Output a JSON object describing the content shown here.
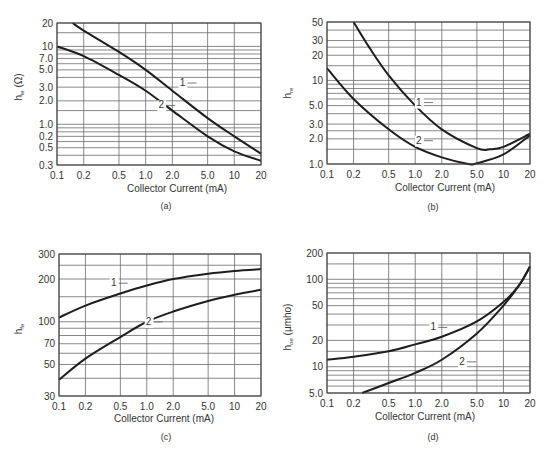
{
  "figure": {
    "panels": [
      "(a)",
      "(b)",
      "(c)",
      "(d)"
    ]
  },
  "chart_data": [
    {
      "id": "a",
      "type": "line",
      "panel_label": "(a)",
      "xlabel": "Collector Current (mA)",
      "ylabel": "h_ie (Ω)",
      "ylabel_main": "h",
      "ylabel_sub": "ie",
      "ylabel_unit": " (Ω)",
      "xscale": "log",
      "yscale": "log",
      "xlim": [
        0.1,
        20
      ],
      "ylim": [
        0.3,
        20
      ],
      "grid": true,
      "xticks": [
        0.1,
        0.2,
        0.5,
        1.0,
        2.0,
        5.0,
        10,
        20
      ],
      "xtick_labels": [
        "0.1",
        "0.2",
        "0.5",
        "1.0",
        "2.0",
        "5.0",
        "10",
        "20"
      ],
      "yticks": [
        0.3,
        0.5,
        0.7,
        1.0,
        2.0,
        3.0,
        5.0,
        7.0,
        10,
        20
      ],
      "ytick_labels": [
        "0.3",
        "0.5",
        "0.2",
        "1.0",
        "2.0",
        "3.0",
        "5.0",
        "7.0",
        "10",
        "20"
      ],
      "ygrid_minor": [
        0.4,
        0.6,
        0.8,
        0.9,
        1.5,
        4,
        6,
        8,
        9,
        15
      ],
      "series": [
        {
          "name": "1",
          "x": [
            0.15,
            0.2,
            0.5,
            1.0,
            2.0,
            5.0,
            10,
            20
          ],
          "y": [
            20,
            16,
            8.5,
            5.0,
            2.7,
            1.2,
            0.7,
            0.42
          ]
        },
        {
          "name": "2",
          "x": [
            0.1,
            0.2,
            0.5,
            1.0,
            2.0,
            5.0,
            10,
            20
          ],
          "y": [
            10,
            7.5,
            4.3,
            2.7,
            1.5,
            0.7,
            0.45,
            0.34
          ]
        }
      ],
      "annotations": [
        {
          "text": "1",
          "x": 2.6,
          "y": 3.1
        },
        {
          "text": "2",
          "x": 1.5,
          "y": 1.6
        }
      ]
    },
    {
      "id": "b",
      "type": "line",
      "panel_label": "(b)",
      "xlabel": "Collector Current (mA)",
      "ylabel": "h_re",
      "ylabel_main": "h",
      "ylabel_sub": "re",
      "ylabel_unit": "",
      "xscale": "log",
      "yscale": "log",
      "xlim": [
        0.1,
        20
      ],
      "ylim": [
        1.0,
        50
      ],
      "grid": true,
      "xticks": [
        0.1,
        0.2,
        0.5,
        1.0,
        2.0,
        5.0,
        10,
        20
      ],
      "xtick_labels": [
        "0.1",
        "0.2",
        "0.5",
        "1.0",
        "2.0",
        "5.0",
        "10",
        "20"
      ],
      "yticks": [
        1.0,
        2.0,
        3.0,
        5.0,
        10,
        20,
        30,
        50
      ],
      "ytick_labels": [
        "1.0",
        "2.0",
        "3.0",
        "5.0",
        "10",
        "20",
        "30",
        "50"
      ],
      "ygrid_minor": [
        1.5,
        2.5,
        4,
        6,
        7,
        8,
        9,
        15,
        25,
        40
      ],
      "series": [
        {
          "name": "1",
          "x": [
            0.2,
            0.3,
            0.5,
            1.0,
            2.0,
            5.0,
            7.0,
            10,
            20
          ],
          "y": [
            50,
            25,
            11.5,
            5.0,
            2.6,
            1.55,
            1.5,
            1.6,
            2.3
          ]
        },
        {
          "name": "2",
          "x": [
            0.1,
            0.2,
            0.5,
            1.0,
            2.0,
            4.0,
            5.0,
            10,
            20
          ],
          "y": [
            14,
            6.0,
            2.6,
            1.6,
            1.2,
            1.0,
            1.02,
            1.3,
            2.2
          ]
        }
      ],
      "annotations": [
        {
          "text": "1",
          "x": 1.1,
          "y": 5.0
        },
        {
          "text": "2",
          "x": 1.1,
          "y": 1.75
        }
      ]
    },
    {
      "id": "c",
      "type": "line",
      "panel_label": "(c)",
      "xlabel": "Collector Current (mA)",
      "ylabel": "h_fe",
      "ylabel_main": "h",
      "ylabel_sub": "fe",
      "ylabel_unit": "",
      "xscale": "log",
      "yscale": "log",
      "xlim": [
        0.1,
        20
      ],
      "ylim": [
        30,
        300
      ],
      "grid": true,
      "xticks": [
        0.1,
        0.2,
        0.5,
        1.0,
        2.0,
        5.0,
        10,
        20
      ],
      "xtick_labels": [
        "0.1",
        "0.2",
        "0.5",
        "1.0",
        "2.0",
        "5.0",
        "10",
        "20"
      ],
      "yticks": [
        30,
        50,
        70,
        100,
        200,
        300
      ],
      "ytick_labels": [
        "30",
        "50",
        "70",
        "100",
        "200",
        "300"
      ],
      "ygrid_minor": [
        40,
        60,
        80,
        90,
        150,
        250
      ],
      "series": [
        {
          "name": "1",
          "x": [
            0.1,
            0.2,
            0.5,
            1.0,
            2.0,
            5.0,
            10,
            20
          ],
          "y": [
            107,
            130,
            158,
            180,
            200,
            218,
            228,
            235
          ]
        },
        {
          "name": "2",
          "x": [
            0.1,
            0.2,
            0.5,
            1.0,
            2.0,
            5.0,
            10,
            20
          ],
          "y": [
            39,
            55,
            78,
            100,
            118,
            140,
            155,
            168
          ]
        }
      ],
      "annotations": [
        {
          "text": "1",
          "x": 0.42,
          "y": 178
        },
        {
          "text": "2",
          "x": 1.05,
          "y": 95
        }
      ]
    },
    {
      "id": "d",
      "type": "line",
      "panel_label": "(d)",
      "xlabel": "Collector Current (mA)",
      "ylabel": "h_oe (µmho)",
      "ylabel_main": "h",
      "ylabel_sub": "oe",
      "ylabel_unit": " (µmho)",
      "xscale": "log",
      "yscale": "log",
      "xlim": [
        0.1,
        20
      ],
      "ylim": [
        5.0,
        200
      ],
      "grid": true,
      "xticks": [
        0.1,
        0.2,
        0.5,
        1.0,
        2.0,
        5.0,
        10,
        20
      ],
      "xtick_labels": [
        "0.1",
        "0.2",
        "0.5",
        "1.0",
        "2.0",
        "5.0",
        "10",
        "20"
      ],
      "yticks": [
        5.0,
        10,
        20,
        50,
        100,
        200
      ],
      "ytick_labels": [
        "5.0",
        "10",
        "20",
        "50",
        "100",
        "200"
      ],
      "ygrid_minor": [
        6,
        7,
        8,
        9,
        15,
        30,
        40,
        60,
        70,
        80,
        90,
        150
      ],
      "series": [
        {
          "name": "1",
          "x": [
            0.1,
            0.2,
            0.5,
            1.0,
            2.0,
            5.0,
            10,
            15,
            20
          ],
          "y": [
            12,
            13,
            15,
            18,
            22,
            33,
            55,
            85,
            140
          ]
        },
        {
          "name": "2",
          "x": [
            0.25,
            0.5,
            1.0,
            2.0,
            5.0,
            10,
            15,
            20
          ],
          "y": [
            5.0,
            6.5,
            8.5,
            12,
            24,
            50,
            85,
            140
          ]
        }
      ],
      "annotations": [
        {
          "text": "1",
          "x": 1.6,
          "y": 26
        },
        {
          "text": "2",
          "x": 3.4,
          "y": 10.5
        }
      ]
    }
  ]
}
